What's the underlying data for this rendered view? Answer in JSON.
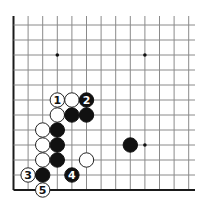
{
  "diagram": {
    "type": "go-board-diagram",
    "board_corner": "bottom-left",
    "grid": {
      "columns": 13,
      "rows": 12,
      "origin_x": 13.5,
      "origin_y": 25,
      "col_spacing": 14.6,
      "row_spacing": 15.0,
      "line_top": 16,
      "line_right": 195,
      "left_edge_thick": true,
      "bottom_edge_thick": true,
      "line_color": "#8a8a8a",
      "edge_color": "#1a1a1a"
    },
    "star_points": [
      {
        "col": 3,
        "row": 2
      },
      {
        "col": 9,
        "row": 2
      },
      {
        "col": 9,
        "row": 8
      }
    ],
    "stones": [
      {
        "color": "white",
        "col": 3,
        "row": 5,
        "label": "1"
      },
      {
        "color": "white",
        "col": 4,
        "row": 5,
        "label": ""
      },
      {
        "color": "black",
        "col": 5,
        "row": 5,
        "label": "2"
      },
      {
        "color": "white",
        "col": 3,
        "row": 6,
        "label": ""
      },
      {
        "color": "black",
        "col": 4,
        "row": 6,
        "label": ""
      },
      {
        "color": "black",
        "col": 5,
        "row": 6,
        "label": ""
      },
      {
        "color": "white",
        "col": 2,
        "row": 7,
        "label": ""
      },
      {
        "color": "black",
        "col": 3,
        "row": 7,
        "label": ""
      },
      {
        "color": "white",
        "col": 2,
        "row": 8,
        "label": ""
      },
      {
        "color": "black",
        "col": 3,
        "row": 8,
        "label": ""
      },
      {
        "color": "white",
        "col": 2,
        "row": 9,
        "label": ""
      },
      {
        "color": "black",
        "col": 3,
        "row": 9,
        "label": ""
      },
      {
        "color": "white",
        "col": 5,
        "row": 9,
        "label": ""
      },
      {
        "color": "white",
        "col": 1,
        "row": 10,
        "label": "3"
      },
      {
        "color": "black",
        "col": 2,
        "row": 10,
        "label": ""
      },
      {
        "color": "black",
        "col": 4,
        "row": 10,
        "label": "4"
      },
      {
        "color": "white",
        "col": 2,
        "row": 11,
        "label": "5"
      },
      {
        "color": "black",
        "col": 8,
        "row": 8,
        "label": ""
      }
    ],
    "colors": {
      "black_stone": "#111111",
      "white_stone": "#ffffff",
      "white_stone_outline": "#222222",
      "black_label": "#ffffff",
      "white_label": "#111111",
      "star_point": "#111111"
    },
    "stone_radius": 7.2
  }
}
